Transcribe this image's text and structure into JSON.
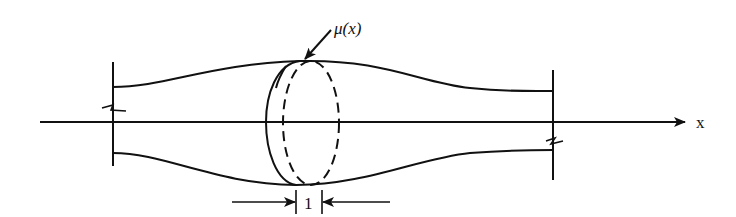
{
  "diagram": {
    "type": "beam-segment-with-cross-section",
    "labels": {
      "density": "μ(x)",
      "axis": "x",
      "slice_width": "1"
    },
    "elements": [
      {
        "id": "x-axis",
        "description": "horizontal axis with arrow pointing right"
      },
      {
        "id": "beam-top-profile",
        "description": "curved upper boundary of varying-thickness beam"
      },
      {
        "id": "beam-bottom-profile",
        "description": "curved lower boundary of beam"
      },
      {
        "id": "left-end-cut",
        "description": "vertical cut line with break symbol at left end"
      },
      {
        "id": "right-end-cut",
        "description": "vertical cut line with break symbol at right end"
      },
      {
        "id": "cross-section-solid",
        "description": "front solid elliptical face of slice"
      },
      {
        "id": "cross-section-dashed",
        "description": "hidden dashed elliptical face of slice"
      },
      {
        "id": "slice-width-dimension",
        "description": "dimension arrows indicating unit slice width"
      }
    ],
    "colors": {
      "stroke": "#111111",
      "background": "#ffffff"
    }
  }
}
